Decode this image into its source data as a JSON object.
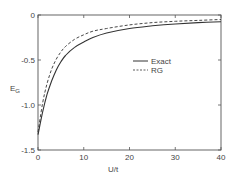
{
  "chart_data": {
    "type": "line",
    "title": "",
    "xlabel": "U/t",
    "ylabel": "E_G",
    "xlim": [
      0,
      40
    ],
    "ylim": [
      -1.5,
      0
    ],
    "grid": false,
    "legend_position": "center-right",
    "x_ticks": [
      0,
      10,
      20,
      30,
      40
    ],
    "x_tick_labels": [
      "0",
      "10",
      "20",
      "30",
      "40"
    ],
    "y_ticks": [
      0,
      -0.5,
      -1.0,
      -1.5
    ],
    "y_tick_labels": [
      "0",
      "-0.5",
      "-1.0",
      "-1.5"
    ],
    "series": [
      {
        "name": "Exact",
        "style": "solid",
        "x": [
          0,
          1,
          2,
          3,
          4,
          5,
          6,
          8,
          10,
          12,
          15,
          20,
          25,
          30,
          35,
          40
        ],
        "y": [
          -1.33,
          -1.08,
          -0.88,
          -0.73,
          -0.61,
          -0.52,
          -0.45,
          -0.36,
          -0.3,
          -0.25,
          -0.2,
          -0.15,
          -0.12,
          -0.1,
          -0.085,
          -0.075
        ]
      },
      {
        "name": "RG",
        "style": "dashed",
        "x": [
          0,
          1,
          2,
          3,
          4,
          5,
          6,
          8,
          10,
          12,
          15,
          20,
          25,
          30,
          35,
          40
        ],
        "y": [
          -1.3,
          -0.98,
          -0.76,
          -0.6,
          -0.49,
          -0.41,
          -0.35,
          -0.27,
          -0.22,
          -0.18,
          -0.15,
          -0.11,
          -0.085,
          -0.07,
          -0.06,
          -0.05
        ]
      }
    ]
  },
  "legend": {
    "items": [
      {
        "label": "Exact",
        "style": "solid"
      },
      {
        "label": "RG",
        "style": "dashed"
      }
    ]
  },
  "axes": {
    "xlabel": "U/t",
    "ylabel_main": "E",
    "ylabel_sub": "G"
  }
}
